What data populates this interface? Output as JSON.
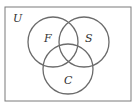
{
  "diagram": {
    "type": "venn",
    "universe": {
      "label": "U"
    },
    "sets": [
      {
        "label": "F"
      },
      {
        "label": "S"
      },
      {
        "label": "C"
      }
    ],
    "colors": {
      "stroke": "#6b6b6b",
      "frame": "#7a7a7a",
      "text": "#333333"
    }
  }
}
